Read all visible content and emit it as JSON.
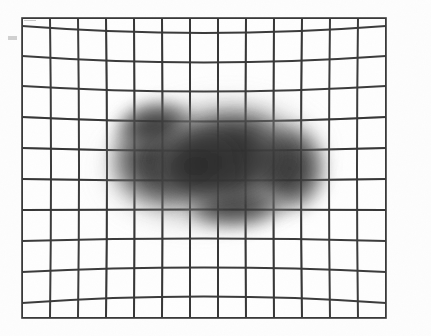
{
  "figure": {
    "domain": "Natural-Image",
    "kind": "radiographic-grid-phantom",
    "title": "Distorted grid phantom with dark elongated mass",
    "canvas": {
      "width": 431,
      "height": 336,
      "background_color": "#fdfdfd"
    }
  },
  "frame": {
    "name": "grid-outer-frame",
    "x": 22,
    "y": 18,
    "width": 364,
    "height": 300,
    "stroke_color": "#3a3a3a",
    "stroke_width": 1.6,
    "fill_color": "#fefefe"
  },
  "grid": {
    "name": "distorted-grid",
    "columns": 13,
    "rows": 10,
    "line_color": "#3c3c3c",
    "line_width": 2.0,
    "distortion_type": "pincushion",
    "horizontal_bow_px": 11,
    "vertical_bow_px": 4,
    "notes": "Interior horizontal lines sag downward near the top of the frame and bow upward near the bottom; vertical lines bow slightly inward toward the horizontal centre."
  },
  "mass": {
    "name": "dark-soft-tissue-mass",
    "label": "dark elongated blob",
    "center_x": 212,
    "center_y": 162,
    "radius_x": 112,
    "radius_y": 62,
    "rotation_deg": -7,
    "core_color": "#303030",
    "mid_color": "#545454",
    "edge_color": "#9a9a9a",
    "opacity": 0.92,
    "bounds": {
      "left": 100,
      "top": 100,
      "right": 325,
      "bottom": 226
    },
    "lobes": [
      {
        "cx": 165,
        "cy": 158,
        "rx": 62,
        "ry": 56,
        "rot": -8
      },
      {
        "cx": 232,
        "cy": 160,
        "rx": 74,
        "ry": 60,
        "rot": -6
      },
      {
        "cx": 288,
        "cy": 168,
        "rx": 44,
        "ry": 50,
        "rot": -4
      }
    ]
  },
  "artifacts": [
    {
      "name": "left-margin-speck",
      "x": 8,
      "y": 36,
      "width": 9,
      "height": 4,
      "color": "#c9c9c9"
    },
    {
      "name": "top-left-corner-tick",
      "x": 24,
      "y": 20,
      "width": 12,
      "height": 1,
      "color": "#bdbdbd"
    }
  ],
  "chart_data": {
    "type": "heatmap",
    "title": "Distorted grid phantom with dark elongated mass",
    "xlabel": "",
    "ylabel": "",
    "grid": true,
    "legend": "none",
    "grid_columns": 13,
    "grid_rows": 10,
    "density_scale": [
      "#fefefe",
      "#9a9a9a",
      "#545454",
      "#303030"
    ]
  }
}
